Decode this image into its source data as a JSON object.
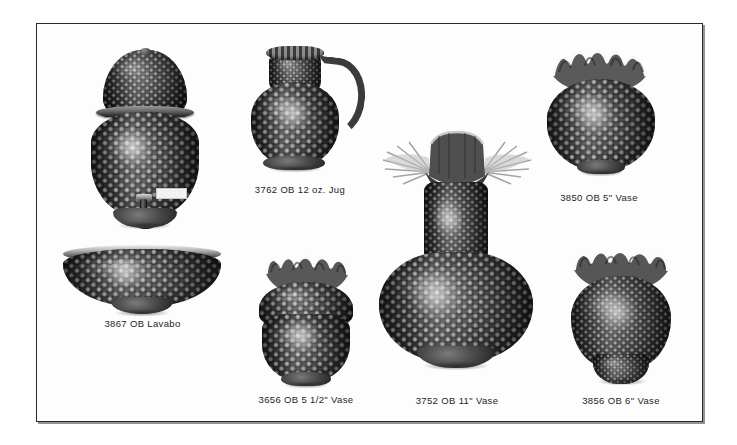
{
  "page": {
    "kind": "product-catalog-plate",
    "background_color": "#ffffff",
    "plate_background_color": "#fdfdfd",
    "border_color": "#2a2a2a",
    "caption_color": "#1d1d1d",
    "photo_style": "black-and-white",
    "product_line": "Hobnail Opaque Blue (OB) Glass"
  },
  "items": [
    {
      "id": "beverage-dispenser",
      "caption": "",
      "item_number": "",
      "finish_code": "",
      "description": "Covered hobnail beverage dispenser with domed lid, metal band and spigot",
      "has_caption": false,
      "shape": "dispenser",
      "rim": "domed-lid",
      "label_sticker": true
    },
    {
      "id": "jug-12oz",
      "caption": "3762 OB 12 oz. Jug",
      "item_number": "3762",
      "finish_code": "OB",
      "size": "12 oz.",
      "description": "Jug",
      "has_caption": true,
      "shape": "jug",
      "rim": "crimped-spout",
      "handle": true
    },
    {
      "id": "vase-5in",
      "caption": "3850 OB 5\" Vase",
      "item_number": "3850",
      "finish_code": "OB",
      "size": "5\"",
      "description": "Vase",
      "has_caption": true,
      "shape": "squat-bowl-vase",
      "rim": "double-crimped-ruffle"
    },
    {
      "id": "lavabo",
      "caption": "3867 OB Lavabo",
      "item_number": "3867",
      "finish_code": "OB",
      "size": "",
      "description": "Lavabo",
      "has_caption": true,
      "shape": "wide-bowl",
      "rim": "plain-rolled"
    },
    {
      "id": "vase-5-5in",
      "caption": "3656 OB 5 1/2\" Vase",
      "item_number": "3656",
      "finish_code": "OB",
      "size": "5 1/2\"",
      "description": "Vase",
      "has_caption": true,
      "shape": "ovoid-vase",
      "rim": "double-crimped-ruffle"
    },
    {
      "id": "vase-11in",
      "caption": "3752 OB 11\" Vase",
      "item_number": "3752",
      "finish_code": "OB",
      "size": "11\"",
      "description": "Vase",
      "has_caption": true,
      "shape": "tall-bulbous-vase",
      "rim": "wide-flared-crimped-ruffle"
    },
    {
      "id": "vase-6in",
      "caption": "3856 OB 6\" Vase",
      "item_number": "3856",
      "finish_code": "OB",
      "size": "6\"",
      "description": "Vase",
      "has_caption": true,
      "shape": "footed-ovoid-vase",
      "rim": "double-crimped-ruffle"
    }
  ]
}
